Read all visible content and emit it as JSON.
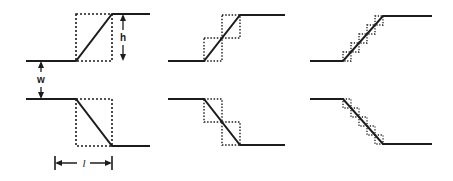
{
  "figure": {
    "type": "technical-diagram",
    "background_color": "#ffffff",
    "line_color": "#1c1c1c",
    "width": 453,
    "height": 181
  },
  "labels": {
    "height": "h",
    "width": "w",
    "length": "l"
  },
  "panels": [
    {
      "id": "top-left",
      "direction": "ascending",
      "step_count": 1,
      "step_size": "large",
      "has_dimensions": true,
      "dimension_labels": [
        "h",
        "w"
      ]
    },
    {
      "id": "top-middle",
      "direction": "ascending",
      "step_count": 2,
      "step_size": "medium",
      "has_dimensions": false,
      "dimension_labels": []
    },
    {
      "id": "top-right",
      "direction": "ascending",
      "step_count": 5,
      "step_size": "small",
      "has_dimensions": false,
      "dimension_labels": []
    },
    {
      "id": "bottom-left",
      "direction": "descending",
      "step_count": 1,
      "step_size": "large",
      "has_dimensions": true,
      "dimension_labels": [
        "l"
      ]
    },
    {
      "id": "bottom-middle",
      "direction": "descending",
      "step_count": 2,
      "step_size": "medium",
      "has_dimensions": false,
      "dimension_labels": []
    },
    {
      "id": "bottom-right",
      "direction": "descending",
      "step_count": 5,
      "step_size": "small",
      "has_dimensions": false,
      "dimension_labels": []
    }
  ]
}
